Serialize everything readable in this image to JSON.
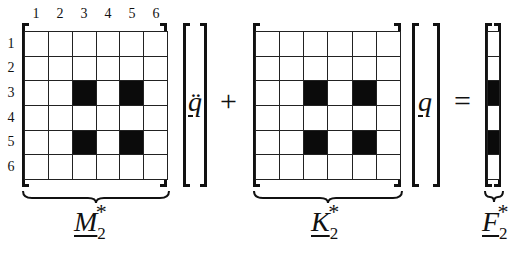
{
  "diagram": {
    "column_indices": [
      "1",
      "2",
      "3",
      "4",
      "5",
      "6"
    ],
    "row_indices": [
      "1",
      "2",
      "3",
      "4",
      "5",
      "6"
    ],
    "mass_matrix": {
      "label": "M",
      "subscript": "2",
      "superscript": "*",
      "filled": [
        [
          0,
          0,
          0,
          0,
          0,
          0
        ],
        [
          0,
          0,
          0,
          0,
          0,
          0
        ],
        [
          0,
          0,
          1,
          0,
          1,
          0
        ],
        [
          0,
          0,
          0,
          0,
          0,
          0
        ],
        [
          0,
          0,
          1,
          0,
          1,
          0
        ],
        [
          0,
          0,
          0,
          0,
          0,
          0
        ]
      ]
    },
    "acceleration_vector": {
      "label": "q̈"
    },
    "plus": "+",
    "stiffness_matrix": {
      "label": "K",
      "subscript": "2",
      "superscript": "*",
      "filled": [
        [
          0,
          0,
          0,
          0,
          0,
          0
        ],
        [
          0,
          0,
          0,
          0,
          0,
          0
        ],
        [
          0,
          0,
          1,
          0,
          1,
          0
        ],
        [
          0,
          0,
          0,
          0,
          0,
          0
        ],
        [
          0,
          0,
          1,
          0,
          1,
          0
        ],
        [
          0,
          0,
          0,
          0,
          0,
          0
        ]
      ]
    },
    "displacement_vector": {
      "label": "q"
    },
    "equals": "=",
    "force_vector": {
      "label": "F",
      "subscript": "2",
      "superscript": "*",
      "filled": [
        0,
        0,
        1,
        0,
        1,
        0
      ]
    },
    "colors": {
      "ink": "#111111",
      "filled_cell": "#0b0b0b",
      "background": "#ffffff"
    }
  }
}
